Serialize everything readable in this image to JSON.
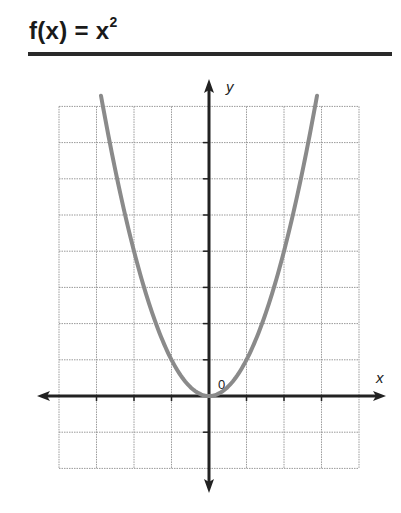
{
  "title": {
    "main": "f(x) = x",
    "superscript": "2"
  },
  "chart_data": {
    "type": "line",
    "function": "x^2",
    "xlabel": "x",
    "ylabel": "y",
    "origin_label": "0",
    "xlim": [
      -4,
      4
    ],
    "ylim": [
      -2,
      8
    ],
    "grid": true,
    "grid_spacing": 1,
    "x": [
      -2.9,
      -2.5,
      -2,
      -1.5,
      -1,
      -0.5,
      0,
      0.5,
      1,
      1.5,
      2,
      2.5,
      2.9
    ],
    "y": [
      8.41,
      6.25,
      4,
      2.25,
      1,
      0.25,
      0,
      0.25,
      1,
      2.25,
      4,
      6.25,
      8.41
    ],
    "colors": {
      "curve": "#8a8a8a",
      "axes": "#222222",
      "grid": "#9a9a9a"
    }
  },
  "axes": {
    "x_label": "x",
    "y_label": "y",
    "origin_label": "0"
  }
}
